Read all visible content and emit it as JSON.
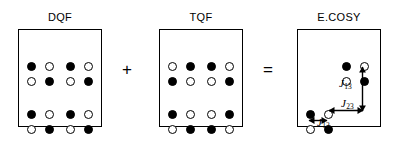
{
  "figure": {
    "background_color": "#ffffff",
    "ink_color": "#000000"
  },
  "panels": [
    {
      "id": "dqf",
      "title": "DQF",
      "box": {
        "x": 18,
        "y": 29,
        "w": 84,
        "h": 98
      },
      "dots": [
        {
          "state": "filled",
          "cx": 30,
          "cy": 47
        },
        {
          "state": "open",
          "cx": 48,
          "cy": 47
        },
        {
          "state": "filled",
          "cx": 69,
          "cy": 47
        },
        {
          "state": "open",
          "cx": 87,
          "cy": 47
        },
        {
          "state": "open",
          "cx": 30,
          "cy": 62
        },
        {
          "state": "filled",
          "cx": 48,
          "cy": 62
        },
        {
          "state": "open",
          "cx": 69,
          "cy": 62
        },
        {
          "state": "filled",
          "cx": 87,
          "cy": 62
        },
        {
          "state": "filled",
          "cx": 30,
          "cy": 95
        },
        {
          "state": "open",
          "cx": 48,
          "cy": 95
        },
        {
          "state": "filled",
          "cx": 69,
          "cy": 95
        },
        {
          "state": "open",
          "cx": 87,
          "cy": 95
        },
        {
          "state": "open",
          "cx": 30,
          "cy": 110
        },
        {
          "state": "filled",
          "cx": 48,
          "cy": 110
        },
        {
          "state": "open",
          "cx": 69,
          "cy": 110
        },
        {
          "state": "filled",
          "cx": 87,
          "cy": 110
        }
      ]
    },
    {
      "id": "tqf",
      "title": "TQF",
      "box": {
        "x": 159,
        "y": 29,
        "w": 84,
        "h": 98
      },
      "dots": [
        {
          "state": "open",
          "cx": 171,
          "cy": 47
        },
        {
          "state": "filled",
          "cx": 189,
          "cy": 47
        },
        {
          "state": "filled",
          "cx": 210,
          "cy": 47
        },
        {
          "state": "open",
          "cx": 228,
          "cy": 47
        },
        {
          "state": "filled",
          "cx": 171,
          "cy": 62
        },
        {
          "state": "open",
          "cx": 189,
          "cy": 62
        },
        {
          "state": "open",
          "cx": 210,
          "cy": 62
        },
        {
          "state": "filled",
          "cx": 228,
          "cy": 62
        },
        {
          "state": "filled",
          "cx": 171,
          "cy": 95
        },
        {
          "state": "open",
          "cx": 189,
          "cy": 95
        },
        {
          "state": "open",
          "cx": 210,
          "cy": 95
        },
        {
          "state": "filled",
          "cx": 228,
          "cy": 95
        },
        {
          "state": "open",
          "cx": 171,
          "cy": 110
        },
        {
          "state": "filled",
          "cx": 189,
          "cy": 110
        },
        {
          "state": "filled",
          "cx": 210,
          "cy": 110
        },
        {
          "state": "open",
          "cx": 228,
          "cy": 110
        }
      ]
    },
    {
      "id": "ecosy",
      "title": "E.COSY",
      "box": {
        "x": 297,
        "y": 29,
        "w": 84,
        "h": 98
      },
      "dots": [
        {
          "state": "filled",
          "cx": 345,
          "cy": 47
        },
        {
          "state": "open",
          "cx": 363,
          "cy": 47
        },
        {
          "state": "open",
          "cx": 345,
          "cy": 62
        },
        {
          "state": "filled",
          "cx": 363,
          "cy": 62
        },
        {
          "state": "filled",
          "cx": 309,
          "cy": 95
        },
        {
          "state": "open",
          "cx": 327,
          "cy": 95
        },
        {
          "state": "open",
          "cx": 309,
          "cy": 110
        },
        {
          "state": "filled",
          "cx": 327,
          "cy": 110
        }
      ]
    }
  ],
  "operators": [
    {
      "id": "plus",
      "symbol": "+",
      "x": 127,
      "y": 70
    },
    {
      "id": "equals",
      "symbol": "=",
      "x": 268,
      "y": 70
    }
  ],
  "couplings": [
    {
      "id": "j13",
      "label": "J",
      "subscript": "13",
      "orientation": "vertical",
      "label_x": 339,
      "label_y": 78,
      "arrow": {
        "x": 362,
        "y": 66,
        "length": 46
      }
    },
    {
      "id": "j23",
      "label": "J",
      "subscript": "23",
      "orientation": "horizontal",
      "label_x": 341,
      "label_y": 98,
      "arrow": {
        "x": 328,
        "y": 110,
        "length": 36
      }
    },
    {
      "id": "j12",
      "label": "J",
      "subscript": "12",
      "orientation": "horizontal",
      "label_x": 317,
      "label_y": 117,
      "arrow": {
        "x": 308,
        "y": 120,
        "length": 20
      }
    }
  ]
}
